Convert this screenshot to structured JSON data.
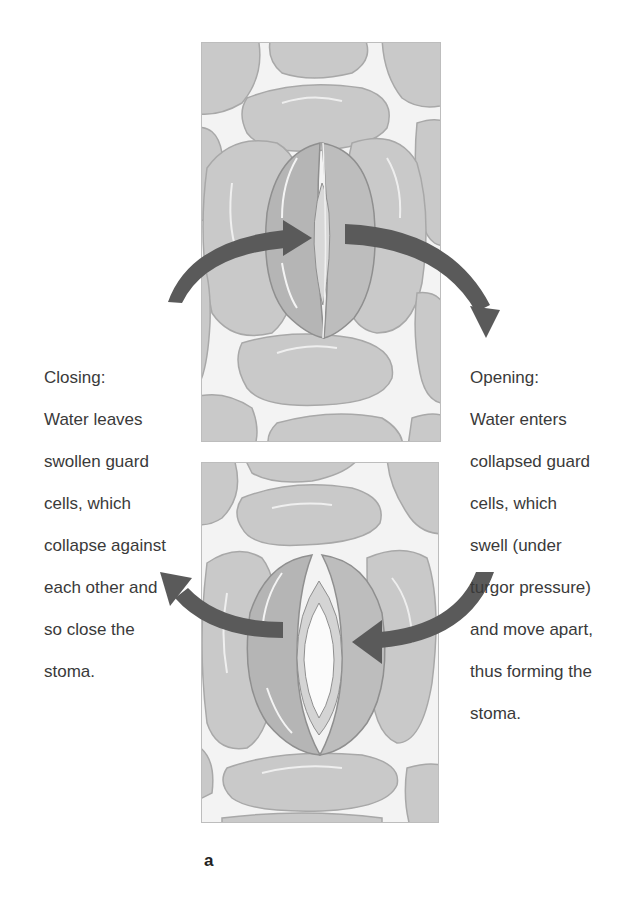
{
  "figure": {
    "label": "a",
    "panels": [
      {
        "id": "top",
        "state": "closed stoma (guard cells collapsed)"
      },
      {
        "id": "bottom",
        "state": "open stoma (guard cells swollen)"
      }
    ],
    "captions": {
      "closing": {
        "title": "Closing:",
        "lines": [
          "Water leaves",
          "swollen guard",
          "cells, which",
          "collapse against",
          "each other and",
          "so close the",
          "stoma."
        ]
      },
      "opening": {
        "title": "Opening:",
        "lines": [
          "Water enters",
          "collapsed guard",
          "cells, which",
          "swell (under",
          "turgor pressure)",
          "and move apart,",
          "thus forming the",
          "stoma."
        ]
      }
    },
    "colors": {
      "cell_fill": "#c9c9c9",
      "cell_edge": "#a9a9a9",
      "guard_cell_fill": "#b3b3b3",
      "background": "#f4f4f4",
      "arrow": "#5a5a5a"
    }
  }
}
